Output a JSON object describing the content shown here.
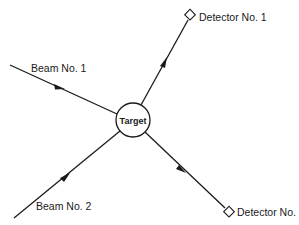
{
  "diagram": {
    "type": "scattering-experiment",
    "target": {
      "label": "Target",
      "cx": 133,
      "cy": 120,
      "r": 17
    },
    "beams": [
      {
        "label": "Beam No. 1",
        "x1": 10,
        "y1": 65,
        "label_x": 31,
        "label_y": 72
      },
      {
        "label": "Beam No. 2",
        "x1": 14,
        "y1": 218,
        "label_x": 36,
        "label_y": 210
      }
    ],
    "detectors": [
      {
        "label": "Detector No. 1",
        "x": 190,
        "y": 15,
        "label_x": 199,
        "label_y": 21
      },
      {
        "label": "Detector No. 2",
        "x": 229,
        "y": 212,
        "label_x": 237,
        "label_y": 216
      }
    ],
    "colors": {
      "line": "#1a1a1a",
      "background": "#ffffff"
    }
  }
}
